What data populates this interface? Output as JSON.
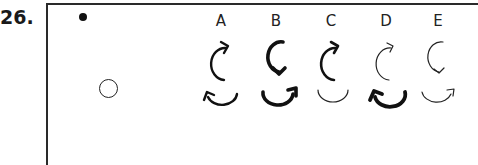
{
  "question": {
    "number": "26."
  },
  "stimulus": {
    "filled_dot": "filled-dot",
    "empty_circle": "empty-circle"
  },
  "options": [
    {
      "label": "A",
      "top_arrow": {
        "direction": "clockwise",
        "weight": "medium"
      },
      "bottom_arrow": {
        "direction": "arrowhead-left",
        "weight": "medium"
      }
    },
    {
      "label": "B",
      "top_arrow": {
        "direction": "counterclockwise-down",
        "weight": "bold"
      },
      "bottom_arrow": {
        "direction": "arrowhead-right",
        "weight": "bold"
      }
    },
    {
      "label": "C",
      "top_arrow": {
        "direction": "clockwise",
        "weight": "medium"
      },
      "bottom_arrow": {
        "direction": "none",
        "weight": "thin"
      }
    },
    {
      "label": "D",
      "top_arrow": {
        "direction": "clockwise",
        "weight": "thin"
      },
      "bottom_arrow": {
        "direction": "arrowhead-left",
        "weight": "bold"
      }
    },
    {
      "label": "E",
      "top_arrow": {
        "direction": "counterclockwise-down",
        "weight": "thin"
      },
      "bottom_arrow": {
        "direction": "arrowhead-right",
        "weight": "thin"
      }
    }
  ]
}
